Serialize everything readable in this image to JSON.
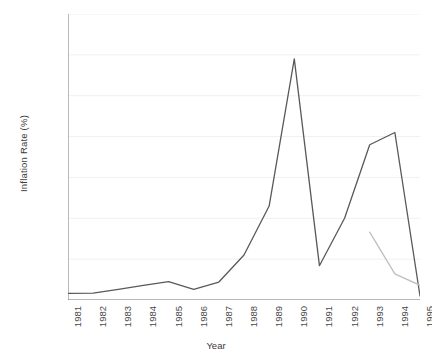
{
  "chart_data": {
    "type": "line",
    "title": "",
    "xlabel": "Year",
    "ylabel": "Inflation Rate (%)",
    "categories": [
      "1981",
      "1982",
      "1983",
      "1984",
      "1985",
      "1986",
      "1987",
      "1988",
      "1989",
      "1990",
      "1991",
      "1992",
      "1993",
      "1994",
      "1995"
    ],
    "x": [
      1981,
      1982,
      1983,
      1984,
      1985,
      1986,
      1987,
      1988,
      1989,
      1990,
      1991,
      1992,
      1993,
      1994,
      1995
    ],
    "xlim": [
      1981,
      1995
    ],
    "ylim": [
      0,
      3500
    ],
    "yticks": [
      0,
      500,
      1000,
      1500,
      2000,
      2500,
      3000,
      3500
    ],
    "ytick_labels": [
      "0",
      "500",
      "1000",
      "1500",
      "2000",
      "2500",
      "3000",
      "3500"
    ],
    "grid": true,
    "grid_axis": "y",
    "legend": "none",
    "series": [
      {
        "name": "series-1",
        "color": "#595959",
        "x": [
          1981,
          1982,
          1983,
          1984,
          1985,
          1986,
          1987,
          1988,
          1989,
          1990,
          1991,
          1992,
          1993,
          1994,
          1995
        ],
        "values": [
          80,
          85,
          130,
          180,
          225,
          130,
          220,
          550,
          1150,
          2950,
          420,
          1000,
          1900,
          2050,
          50
        ]
      },
      {
        "name": "series-2",
        "color": "#bfbfbf",
        "x": [
          1993,
          1994,
          1995
        ],
        "values": [
          830,
          320,
          180
        ]
      }
    ]
  },
  "axes": {
    "ylabel": "Inflation Rate (%)",
    "xlabel": "Year"
  }
}
